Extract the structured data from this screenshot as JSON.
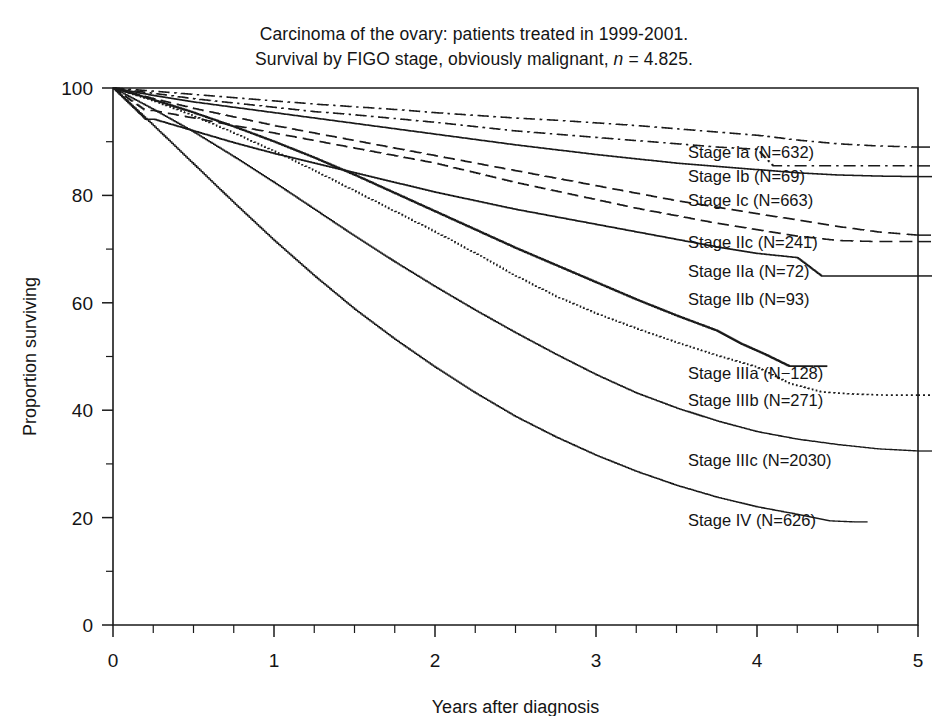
{
  "title": {
    "line1": "Carcinoma of the ovary: patients treated in 1999-2001.",
    "line2_pre": "Survival by FIGO stage, obviously malignant, ",
    "line2_italic": "n",
    "line2_post": " = 4.825."
  },
  "axes": {
    "x_title": "Years after diagnosis",
    "y_title": "Proportion surviving",
    "x_ticks": [
      "0",
      "1",
      "2",
      "3",
      "4",
      "5"
    ],
    "y_ticks": [
      "0",
      "20",
      "40",
      "60",
      "80",
      "100"
    ]
  },
  "chart_data": {
    "type": "line",
    "title": "Carcinoma of the ovary: patients treated in 1999-2001. Survival by FIGO stage, obviously malignant, n = 4.825.",
    "xlabel": "Years after diagnosis",
    "ylabel": "Proportion surviving",
    "xlim": [
      0,
      5
    ],
    "ylim": [
      0,
      100
    ],
    "x_major_step": 1,
    "x_minor_step": 0.25,
    "y_major_step": 20,
    "y_minor_step": 10,
    "grid": false,
    "legend_position": "right-inline",
    "total_n": 4825,
    "series": [
      {
        "name": "Stage Ia",
        "label": "Stage Ia (N=632)",
        "n": 632,
        "style": "dashdot",
        "width": 1.5,
        "label_y": 153,
        "x": [
          0,
          0.25,
          0.5,
          0.75,
          1,
          1.25,
          1.5,
          1.75,
          2,
          2.25,
          2.5,
          2.75,
          3,
          3.25,
          3.5,
          3.75,
          4,
          4.25,
          4.5,
          4.75,
          5
        ],
        "y": [
          100,
          99.4,
          98.8,
          98.2,
          97.6,
          97.0,
          96.5,
          96.0,
          95.4,
          94.9,
          94.4,
          94.0,
          93.5,
          93.0,
          92.4,
          91.8,
          91.2,
          90.3,
          89.6,
          89.2,
          89.0
        ]
      },
      {
        "name": "Stage Ib",
        "label": "Stage Ib (N=69)",
        "n": 69,
        "style": "dashdot",
        "width": 1.5,
        "label_y": 177,
        "x": [
          0,
          0.25,
          0.5,
          0.75,
          1,
          1.25,
          1.5,
          1.75,
          2,
          2.25,
          2.5,
          2.75,
          3,
          3.25,
          3.5,
          3.75,
          4,
          4.1,
          4.25,
          4.5,
          4.75,
          5
        ],
        "y": [
          100,
          99.0,
          98.0,
          97.2,
          96.4,
          95.6,
          95.0,
          94.3,
          93.6,
          92.8,
          92.0,
          91.4,
          90.8,
          90.2,
          89.6,
          89.0,
          88.6,
          85.5,
          85.5,
          85.5,
          85.5,
          85.5
        ]
      },
      {
        "name": "Stage Ic",
        "label": "Stage Ic (N=663)",
        "n": 663,
        "style": "solid",
        "width": 1.5,
        "label_y": 201,
        "x": [
          0,
          0.25,
          0.5,
          0.75,
          1,
          1.25,
          1.5,
          1.75,
          2,
          2.25,
          2.5,
          2.75,
          3,
          3.25,
          3.5,
          3.75,
          4,
          4.25,
          4.5,
          4.75,
          5
        ],
        "y": [
          100,
          98.6,
          97.4,
          96.4,
          95.4,
          94.4,
          93.4,
          92.4,
          91.4,
          90.4,
          89.4,
          88.5,
          87.6,
          86.8,
          86.0,
          85.4,
          84.8,
          84.2,
          83.8,
          83.6,
          83.5
        ]
      },
      {
        "name": "Stage IIc",
        "label": "Stage IIc (N=241)",
        "n": 241,
        "style": "longdash",
        "width": 1.5,
        "label_y": 243,
        "x": [
          0,
          0.25,
          0.5,
          0.75,
          1,
          1.25,
          1.5,
          1.75,
          2,
          2.25,
          2.5,
          2.75,
          3,
          3.25,
          3.5,
          3.75,
          4,
          4.25,
          4.5,
          4.75,
          5
        ],
        "y": [
          100,
          98.0,
          96.2,
          94.6,
          93.0,
          91.6,
          90.2,
          88.8,
          87.4,
          86.0,
          84.6,
          83.2,
          81.8,
          80.4,
          79.0,
          77.8,
          76.6,
          75.4,
          74.2,
          73.2,
          72.6
        ]
      },
      {
        "name": "Stage IIa",
        "label": "Stage IIa (N=72)",
        "n": 72,
        "style": "longdash",
        "width": 1.5,
        "label_y": 272,
        "x": [
          0,
          0.2,
          0.25,
          0.5,
          0.75,
          1,
          1.25,
          1.5,
          1.75,
          2,
          2.25,
          2.5,
          2.75,
          3,
          3.25,
          3.5,
          3.75,
          4,
          4.25,
          4.5,
          4.75,
          5
        ],
        "y": [
          100,
          95.8,
          95.8,
          94.4,
          93.0,
          91.6,
          90.2,
          88.8,
          87.4,
          86.0,
          84.2,
          82.4,
          80.8,
          79.2,
          77.6,
          76.2,
          74.8,
          73.6,
          72.4,
          71.6,
          71.4,
          71.4
        ]
      },
      {
        "name": "Stage IIb",
        "label": "Stage IIb (N=93)",
        "n": 93,
        "style": "solid",
        "width": 1.5,
        "label_y": 300,
        "x": [
          0,
          0.2,
          0.25,
          0.5,
          0.75,
          1,
          1.25,
          1.5,
          1.75,
          2,
          2.25,
          2.5,
          2.75,
          3,
          3.25,
          3.5,
          3.75,
          4,
          4.25,
          4.4,
          4.6,
          4.75,
          5
        ],
        "y": [
          100,
          94.2,
          94.2,
          92.0,
          89.8,
          87.8,
          86.0,
          84.2,
          82.4,
          80.6,
          79.0,
          77.4,
          76.0,
          74.6,
          73.2,
          71.8,
          70.4,
          69.2,
          68.4,
          65.0,
          65.0,
          65.0,
          65.0
        ]
      },
      {
        "name": "Stage IIIa",
        "label": "Stage IIIa (N−128)",
        "n": 128,
        "style": "solid",
        "width": 1.8,
        "label_y": 374,
        "x": [
          0,
          0.25,
          0.5,
          0.75,
          1,
          1.25,
          1.5,
          1.75,
          2,
          2.25,
          2.5,
          2.75,
          3,
          3.25,
          3.5,
          3.75,
          3.9,
          4.05,
          4.2,
          4.35
        ],
        "y": [
          100,
          97.8,
          95.4,
          92.8,
          90.0,
          87.0,
          83.8,
          80.4,
          77.0,
          73.6,
          70.2,
          67.0,
          63.8,
          60.6,
          57.6,
          54.8,
          52.4,
          50.4,
          48.2,
          48.2
        ]
      },
      {
        "name": "Stage IIIb",
        "label": "Stage IIIb (N=271)",
        "n": 271,
        "style": "dotted",
        "width": 1.6,
        "label_y": 401,
        "x": [
          0,
          0.25,
          0.5,
          0.75,
          1,
          1.25,
          1.5,
          1.75,
          2,
          2.25,
          2.5,
          2.75,
          3,
          3.25,
          3.5,
          3.75,
          4,
          4.2,
          4.4,
          4.6,
          4.8,
          5
        ],
        "y": [
          100,
          97.6,
          94.8,
          91.6,
          88.2,
          84.6,
          80.8,
          77.0,
          73.2,
          69.2,
          65.0,
          61.2,
          58.0,
          55.2,
          52.6,
          50.2,
          48.0,
          45.0,
          43.4,
          43.0,
          42.8,
          42.8
        ]
      },
      {
        "name": "Stage IIIc",
        "label": "Stage IIIc (N=2030)",
        "n": 2030,
        "style": "solid",
        "width": 1.3,
        "label_y": 461,
        "x": [
          0,
          0.25,
          0.5,
          0.75,
          1,
          1.25,
          1.5,
          1.75,
          2,
          2.25,
          2.5,
          2.75,
          3,
          3.25,
          3.5,
          3.75,
          4,
          4.25,
          4.5,
          4.75,
          5
        ],
        "y": [
          100,
          96.0,
          91.8,
          87.2,
          82.4,
          77.4,
          72.4,
          67.6,
          63.0,
          58.6,
          54.4,
          50.4,
          46.6,
          43.2,
          40.4,
          38.0,
          36.0,
          34.6,
          33.6,
          32.8,
          32.4
        ]
      },
      {
        "name": "Stage IV",
        "label": "Stage IV (N=626)",
        "n": 626,
        "style": "solid",
        "width": 1.3,
        "label_y": 521,
        "x": [
          0,
          0.25,
          0.5,
          0.75,
          1,
          1.25,
          1.5,
          1.75,
          2,
          2.25,
          2.5,
          2.75,
          3,
          3.25,
          3.5,
          3.75,
          4,
          4.25,
          4.45,
          4.6
        ],
        "y": [
          100,
          93.0,
          85.8,
          78.6,
          71.6,
          65.0,
          58.8,
          53.2,
          48.0,
          43.2,
          38.8,
          35.0,
          31.6,
          28.6,
          26.0,
          23.8,
          22.0,
          20.6,
          19.4,
          19.2
        ]
      }
    ]
  }
}
